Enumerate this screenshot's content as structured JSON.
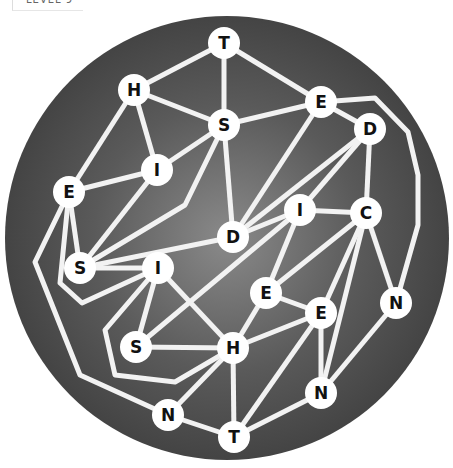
{
  "header": {
    "level_label": "LEVEL 9"
  },
  "board": {
    "background": "#4a4a4a",
    "edge_color": "#f2f2f2",
    "node_fill": "#ffffff",
    "nodes": [
      {
        "id": "n1",
        "letter": "T",
        "x": 224,
        "y": 43
      },
      {
        "id": "n2",
        "letter": "H",
        "x": 134,
        "y": 90
      },
      {
        "id": "n3",
        "letter": "S",
        "x": 224,
        "y": 125
      },
      {
        "id": "n4",
        "letter": "E",
        "x": 321,
        "y": 102
      },
      {
        "id": "n5",
        "letter": "D",
        "x": 370,
        "y": 129
      },
      {
        "id": "n6",
        "letter": "I",
        "x": 157,
        "y": 170
      },
      {
        "id": "n7",
        "letter": "E",
        "x": 69,
        "y": 192
      },
      {
        "id": "n8",
        "letter": "I",
        "x": 300,
        "y": 210
      },
      {
        "id": "n9",
        "letter": "C",
        "x": 366,
        "y": 213
      },
      {
        "id": "n10",
        "letter": "D",
        "x": 233,
        "y": 237
      },
      {
        "id": "n11",
        "letter": "S",
        "x": 80,
        "y": 268
      },
      {
        "id": "n12",
        "letter": "I",
        "x": 158,
        "y": 268
      },
      {
        "id": "n13",
        "letter": "E",
        "x": 266,
        "y": 293
      },
      {
        "id": "n14",
        "letter": "N",
        "x": 396,
        "y": 303
      },
      {
        "id": "n15",
        "letter": "E",
        "x": 321,
        "y": 313
      },
      {
        "id": "n16",
        "letter": "S",
        "x": 136,
        "y": 347
      },
      {
        "id": "n17",
        "letter": "H",
        "x": 233,
        "y": 348
      },
      {
        "id": "n18",
        "letter": "N",
        "x": 321,
        "y": 393
      },
      {
        "id": "n19",
        "letter": "N",
        "x": 168,
        "y": 415
      },
      {
        "id": "n20",
        "letter": "T",
        "x": 234,
        "y": 437
      }
    ]
  }
}
